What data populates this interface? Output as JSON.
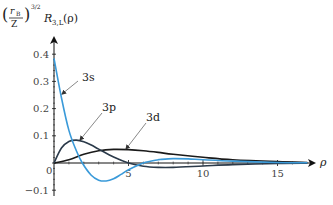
{
  "chart_data": {
    "type": "line",
    "title": "",
    "ylabel": "(r_B/Z)^(3/2) R_{3,L}(ρ)",
    "ylabel_parts": {
      "frac_num": "r",
      "frac_num_sub": "B",
      "frac_den": "Z",
      "exponent": "3/2",
      "func": "R",
      "func_sub": "3,L",
      "arg": "(ρ)"
    },
    "xlabel": "ρ",
    "xlim": [
      0,
      17
    ],
    "ylim": [
      -0.1,
      0.45
    ],
    "x_ticks": [
      0,
      5,
      10,
      15
    ],
    "x_tick_labels": [
      "0",
      "5",
      "10",
      "15"
    ],
    "y_ticks": [
      -0.1,
      0,
      0.1,
      0.2,
      0.3,
      0.4
    ],
    "y_tick_labels": [
      "−0.1",
      "0",
      "0.1",
      "0.2",
      "0.3",
      "0.4"
    ],
    "grid": false,
    "legend": "inline annotations with arrows",
    "series": [
      {
        "name": "3s",
        "color": "#3a9ad9",
        "x": [
          0,
          0.5,
          1,
          1.5,
          1.9,
          2.5,
          3,
          3.5,
          4,
          4.5,
          5,
          6,
          7,
          7.1,
          8,
          9,
          10,
          12,
          15,
          17
        ],
        "values": [
          0.385,
          0.24,
          0.12,
          0.045,
          0.0,
          -0.045,
          -0.063,
          -0.066,
          -0.058,
          -0.042,
          -0.025,
          0.0,
          0.012,
          0.013,
          0.016,
          0.015,
          0.012,
          0.007,
          0.002,
          0.001
        ]
      },
      {
        "name": "3p",
        "color": "#2b3a4a",
        "x": [
          0,
          0.5,
          1,
          1.5,
          2,
          2.5,
          3,
          4,
          5,
          6,
          7,
          8,
          10,
          12,
          15,
          17
        ],
        "values": [
          0,
          0.055,
          0.079,
          0.084,
          0.078,
          0.066,
          0.051,
          0.022,
          0.0,
          -0.012,
          -0.016,
          -0.016,
          -0.011,
          -0.006,
          -0.002,
          -0.001
        ]
      },
      {
        "name": "3d",
        "color": "#1a1a1a",
        "x": [
          0,
          1,
          2,
          3,
          4,
          5,
          6,
          7,
          8,
          10,
          12,
          15,
          17
        ],
        "values": [
          0,
          0.012,
          0.032,
          0.045,
          0.05,
          0.049,
          0.045,
          0.039,
          0.032,
          0.021,
          0.012,
          0.005,
          0.002
        ]
      }
    ],
    "annotations": [
      {
        "text": "3s",
        "target_series": "3s"
      },
      {
        "text": "3p",
        "target_series": "3p"
      },
      {
        "text": "3d",
        "target_series": "3d"
      }
    ]
  }
}
